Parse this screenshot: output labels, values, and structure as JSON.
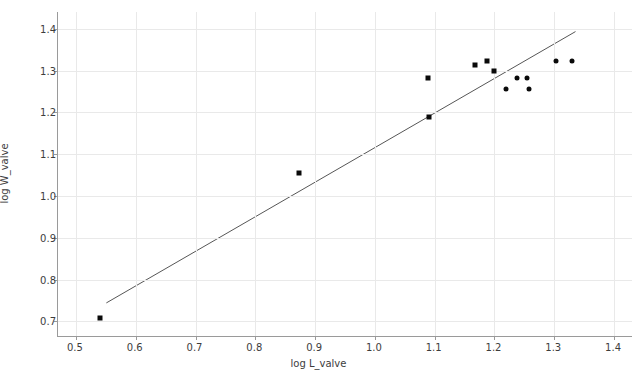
{
  "chart_data": {
    "type": "scatter",
    "title": "",
    "xlabel": "log L_valve",
    "ylabel": "log W_valve",
    "xlim": [
      0.47,
      1.43
    ],
    "ylim": [
      0.665,
      1.44
    ],
    "xticks": [
      "0.5",
      "0.6",
      "0.7",
      "0.8",
      "0.9",
      "1.0",
      "1.1",
      "1.2",
      "1.3",
      "1.4"
    ],
    "xtick_values": [
      0.5,
      0.6,
      0.7,
      0.8,
      0.9,
      1.0,
      1.1,
      1.2,
      1.3,
      1.4
    ],
    "yticks": [
      "0.7",
      "0.8",
      "0.9",
      "1.0",
      "1.1",
      "1.2",
      "1.3",
      "1.4"
    ],
    "ytick_values": [
      0.7,
      0.8,
      0.9,
      1.0,
      1.1,
      1.2,
      1.3,
      1.4
    ],
    "grid": true,
    "legend": false,
    "marker_color": "#0a0a0a",
    "line_color": "#555555",
    "grid_color": "#e9e9e9",
    "axis_color": "#9a9a9a",
    "series": [
      {
        "name": "valve measurements (square markers)",
        "marker": "square",
        "points": [
          {
            "x": 0.541,
            "y": 0.708
          },
          {
            "x": 0.873,
            "y": 1.055
          },
          {
            "x": 1.088,
            "y": 1.281
          },
          {
            "x": 1.09,
            "y": 1.19
          },
          {
            "x": 1.168,
            "y": 1.313
          },
          {
            "x": 1.187,
            "y": 1.323
          },
          {
            "x": 1.2,
            "y": 1.3
          }
        ]
      },
      {
        "name": "valve measurements (round markers)",
        "marker": "circle",
        "points": [
          {
            "x": 1.22,
            "y": 1.257
          },
          {
            "x": 1.238,
            "y": 1.282
          },
          {
            "x": 1.255,
            "y": 1.282
          },
          {
            "x": 1.257,
            "y": 1.255
          },
          {
            "x": 1.303,
            "y": 1.323
          },
          {
            "x": 1.33,
            "y": 1.323
          }
        ]
      }
    ],
    "trendline": {
      "name": "regression fit",
      "x_start": 0.551,
      "y_start": 0.742,
      "x_end": 1.337,
      "y_end": 1.393
    }
  }
}
